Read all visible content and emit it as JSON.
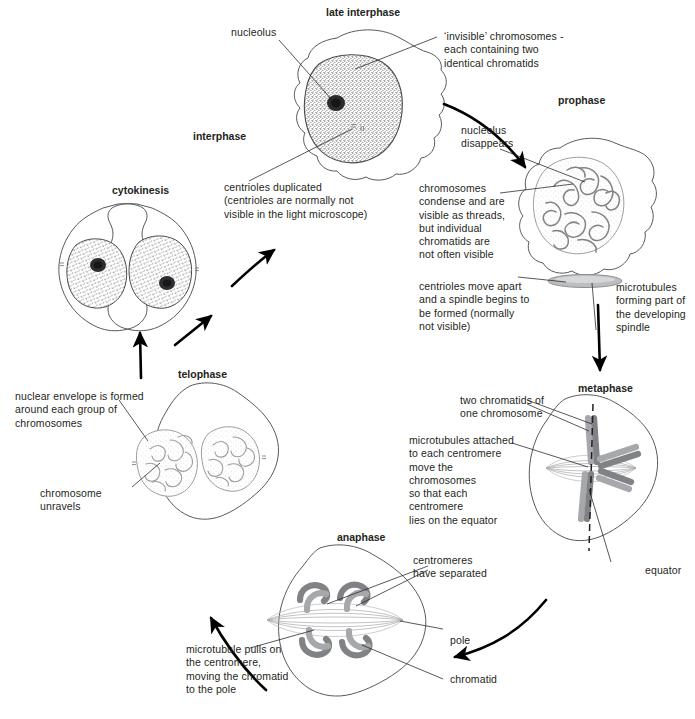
{
  "diagram": {
    "background": "#ffffff",
    "ink": "#231f20",
    "cell_outline_color": "#58595b",
    "chromosome_color": "#808285"
  },
  "stages": [
    {
      "id": "late-interphase",
      "label": "late interphase"
    },
    {
      "id": "prophase",
      "label": "prophase"
    },
    {
      "id": "metaphase",
      "label": "metaphase"
    },
    {
      "id": "anaphase",
      "label": "anaphase"
    },
    {
      "id": "telophase",
      "label": "telophase"
    },
    {
      "id": "cytokinesis",
      "label": "cytokinesis"
    },
    {
      "id": "interphase",
      "label": "interphase"
    }
  ],
  "annotations": {
    "nucleolus": "nucleolus",
    "invisible_chromosomes": "‘invisible’ chromosomes -\neach containing two\nidentical chromatids",
    "centrioles_duplicated": "centrioles duplicated\n(centrioles are normally not\nvisible in the light microscope)",
    "nucleolus_disappears": "nucleolus\ndisappears",
    "chromosomes_condense": "chromosomes\ncondense and are\nvisible as threads,\nbut individual\nchromatids are\nnot often visible",
    "centrioles_move_apart": "centrioles move apart\nand a spindle begins to\nbe formed (normally\nnot visible)",
    "microtubules_spindle": "microtubules\nforming part of\nthe developing\nspindle",
    "two_chromatids": "two chromatids of\none chromosome",
    "microtubules_attached": "microtubules attached\nto each centromere\nmove the chromosomes\nso that each centromere\nlies on the equator",
    "equator": "equator",
    "centromeres_separated": "centromeres\nhave separated",
    "pole": "pole",
    "chromatid": "chromatid",
    "microtubule_pulls": "microtubule pulls on\nthe centromere,\nmoving the chromatid\nto the pole",
    "nuclear_envelope": "nuclear envelope is formed\naround each group of\nchromosomes",
    "chromosome_unravels": "chromosome\nunravels"
  }
}
